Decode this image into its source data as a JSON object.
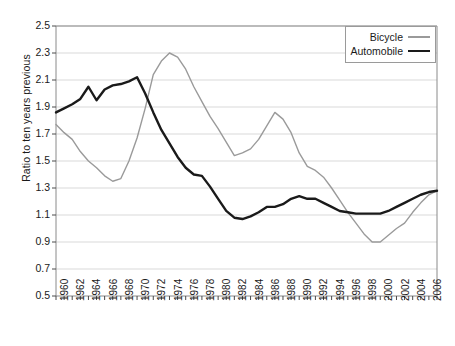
{
  "chart_data": {
    "type": "line",
    "title": "",
    "subtitle": "",
    "xlabel": "",
    "ylabel": "Ratio to ten years previous",
    "xlim": [
      1960,
      2007
    ],
    "ylim": [
      0.5,
      2.5
    ],
    "y_ticks": [
      0.5,
      0.7,
      0.9,
      1.1,
      1.3,
      1.5,
      1.7,
      1.9,
      2.1,
      2.3,
      2.5
    ],
    "y_tick_labels": [
      "0.5",
      "0.7",
      "0.9",
      "1.1",
      "1.3",
      "1.5",
      "1.7",
      "1.9",
      "2.1",
      "2.3",
      "2.5"
    ],
    "x_ticks_all_years": true,
    "x_tick_labels": [
      "1960",
      "1962",
      "1964",
      "1966",
      "1968",
      "1970",
      "1972",
      "1974",
      "1976",
      "1978",
      "1980",
      "1982",
      "1984",
      "1986",
      "1988",
      "1990",
      "1992",
      "1994",
      "1996",
      "1998",
      "2000",
      "2002",
      "2004",
      "2006"
    ],
    "x_tick_label_rotation": -90,
    "grid": "horizontal",
    "grid_color": "#d9d9d9",
    "legend_position": "top-right",
    "x": [
      1960,
      1961,
      1962,
      1963,
      1964,
      1965,
      1966,
      1967,
      1968,
      1969,
      1970,
      1971,
      1972,
      1973,
      1974,
      1975,
      1976,
      1977,
      1978,
      1979,
      1980,
      1981,
      1982,
      1983,
      1984,
      1985,
      1986,
      1987,
      1988,
      1989,
      1990,
      1991,
      1992,
      1993,
      1994,
      1995,
      1996,
      1997,
      1998,
      1999,
      2000,
      2001,
      2002,
      2003,
      2004,
      2005,
      2006,
      2007
    ],
    "series": [
      {
        "name": "Bicycle",
        "color": "#9a9a9a",
        "line_width": 1.4,
        "values": [
          1.77,
          1.71,
          1.66,
          1.57,
          1.5,
          1.45,
          1.39,
          1.35,
          1.37,
          1.5,
          1.67,
          1.89,
          2.14,
          2.24,
          2.3,
          2.27,
          2.18,
          2.05,
          1.94,
          1.83,
          1.74,
          1.64,
          1.54,
          1.56,
          1.59,
          1.66,
          1.76,
          1.86,
          1.81,
          1.71,
          1.56,
          1.46,
          1.43,
          1.38,
          1.3,
          1.21,
          1.12,
          1.04,
          0.96,
          0.9,
          0.9,
          0.95,
          1.0,
          1.04,
          1.12,
          1.19,
          1.25,
          1.28
        ]
      },
      {
        "name": "Automobile",
        "color": "#1a1a1a",
        "line_width": 2.4,
        "values": [
          1.86,
          1.89,
          1.92,
          1.96,
          2.05,
          1.95,
          2.03,
          2.06,
          2.07,
          2.09,
          2.12,
          2.0,
          1.86,
          1.73,
          1.63,
          1.53,
          1.45,
          1.4,
          1.39,
          1.31,
          1.22,
          1.13,
          1.08,
          1.07,
          1.09,
          1.12,
          1.16,
          1.16,
          1.18,
          1.22,
          1.24,
          1.22,
          1.22,
          1.19,
          1.16,
          1.13,
          1.12,
          1.11,
          1.11,
          1.11,
          1.11,
          1.13,
          1.16,
          1.19,
          1.22,
          1.25,
          1.27,
          1.28
        ]
      }
    ]
  },
  "legend": {
    "items": [
      {
        "label": "Bicycle"
      },
      {
        "label": "Automobile"
      }
    ]
  },
  "axes": {
    "y_axis_title": "Ratio to ten years previous"
  }
}
